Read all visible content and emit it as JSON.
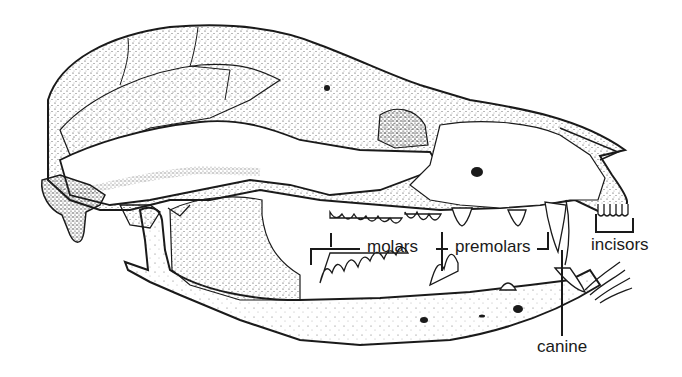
{
  "figure": {
    "background": "#ffffff",
    "ink": "#1a1a1a"
  },
  "labels": {
    "molars": "molars",
    "premolars": "premolars",
    "incisors": "incisors",
    "canine": "canine"
  }
}
